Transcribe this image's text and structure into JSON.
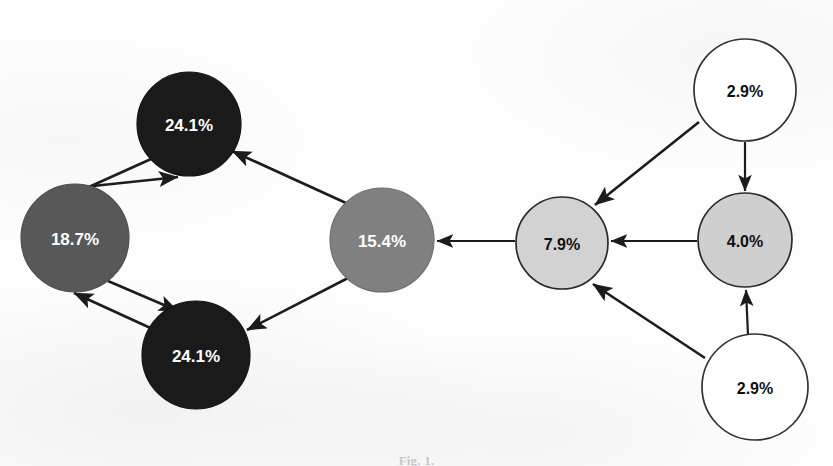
{
  "figure": {
    "caption_label": "Fig. 1.",
    "caption_text": "",
    "type": "directed-graph",
    "background_color": "#fdfdfd",
    "edge_color": "#1c1c1c"
  },
  "chart_data": {
    "type": "diagram",
    "title": "",
    "nodes": [
      {
        "id": "n1",
        "label": "24.1%",
        "value": 24.1,
        "cx": 189,
        "cy": 124,
        "r": 52,
        "fill": "#1a1a1a",
        "stroke": "#141414",
        "text_color": "#ffffff",
        "font_size": 17,
        "tone": "black"
      },
      {
        "id": "n2",
        "label": "18.7%",
        "value": 18.7,
        "cx": 75,
        "cy": 238,
        "r": 54,
        "fill": "#585858",
        "stroke": "#4e4e4e",
        "text_color": "#ffffff",
        "font_size": 17,
        "tone": "dark-gray"
      },
      {
        "id": "n3",
        "label": "24.1%",
        "value": 24.1,
        "cx": 196,
        "cy": 355,
        "r": 54,
        "fill": "#1a1a1a",
        "stroke": "#141414",
        "text_color": "#ffffff",
        "font_size": 17,
        "tone": "black"
      },
      {
        "id": "n4",
        "label": "15.4%",
        "value": 15.4,
        "cx": 382,
        "cy": 240,
        "r": 52,
        "fill": "#808080",
        "stroke": "#6f6f6f",
        "text_color": "#ffffff",
        "font_size": 17,
        "tone": "mid-gray"
      },
      {
        "id": "n5",
        "label": "7.9%",
        "value": 7.9,
        "cx": 562,
        "cy": 243,
        "r": 46,
        "fill": "#d2d2d2",
        "stroke": "#2a2a2a",
        "text_color": "#111111",
        "font_size": 16,
        "tone": "light-gray"
      },
      {
        "id": "n6",
        "label": "4.0%",
        "value": 4.0,
        "cx": 745,
        "cy": 240,
        "r": 47,
        "fill": "#cfcfcf",
        "stroke": "#2a2a2a",
        "text_color": "#111111",
        "font_size": 16,
        "tone": "light-gray"
      },
      {
        "id": "n7",
        "label": "2.9%",
        "value": 2.9,
        "cx": 745,
        "cy": 90,
        "r": 51,
        "fill": "#ffffff",
        "stroke": "#333333",
        "text_color": "#111111",
        "font_size": 16,
        "tone": "white"
      },
      {
        "id": "n8",
        "label": "2.9%",
        "value": 2.9,
        "cx": 755,
        "cy": 387,
        "r": 53,
        "fill": "#ffffff",
        "stroke": "#333333",
        "text_color": "#111111",
        "font_size": 16,
        "tone": "white"
      }
    ],
    "edges": [
      {
        "id": "e1",
        "from": "n1",
        "to": "n2",
        "x1": 151,
        "y1": 159,
        "x2": 38,
        "y2": 210,
        "width": 2.6,
        "head": "end"
      },
      {
        "id": "e2",
        "from": "n2",
        "to": "n1",
        "x1": 93,
        "y1": 186,
        "x2": 178,
        "y2": 177,
        "width": 2.6,
        "head": "end"
      },
      {
        "id": "e3",
        "from": "n2",
        "to": "n3",
        "x1": 108,
        "y1": 281,
        "x2": 178,
        "y2": 311,
        "width": 2.6,
        "head": "end"
      },
      {
        "id": "e4",
        "from": "n3",
        "to": "n2",
        "x1": 157,
        "y1": 331,
        "x2": 74,
        "y2": 293,
        "width": 2.6,
        "head": "end"
      },
      {
        "id": "e5",
        "from": "n4",
        "to": "n1",
        "x1": 346,
        "y1": 203,
        "x2": 232,
        "y2": 151,
        "width": 2.6,
        "head": "end"
      },
      {
        "id": "e6",
        "from": "n4",
        "to": "n3",
        "x1": 348,
        "y1": 278,
        "x2": 247,
        "y2": 330,
        "width": 2.6,
        "head": "end"
      },
      {
        "id": "e7",
        "from": "n5",
        "to": "n4",
        "x1": 515,
        "y1": 241,
        "x2": 437,
        "y2": 241,
        "width": 2.2,
        "head": "end"
      },
      {
        "id": "e8",
        "from": "n6",
        "to": "n5",
        "x1": 697,
        "y1": 241,
        "x2": 611,
        "y2": 241,
        "width": 2.2,
        "head": "end"
      },
      {
        "id": "e9",
        "from": "n7",
        "to": "n5",
        "x1": 699,
        "y1": 122,
        "x2": 595,
        "y2": 205,
        "width": 2.6,
        "head": "end"
      },
      {
        "id": "e10",
        "from": "n7",
        "to": "n6",
        "x1": 745,
        "y1": 142,
        "x2": 745,
        "y2": 191,
        "width": 2.2,
        "head": "end"
      },
      {
        "id": "e11",
        "from": "n8",
        "to": "n5",
        "x1": 705,
        "y1": 358,
        "x2": 593,
        "y2": 284,
        "width": 2.6,
        "head": "end"
      },
      {
        "id": "e12",
        "from": "n8",
        "to": "n6",
        "x1": 748,
        "y1": 335,
        "x2": 746,
        "y2": 290,
        "width": 2.2,
        "head": "end"
      }
    ],
    "legend": null,
    "grid": false
  }
}
